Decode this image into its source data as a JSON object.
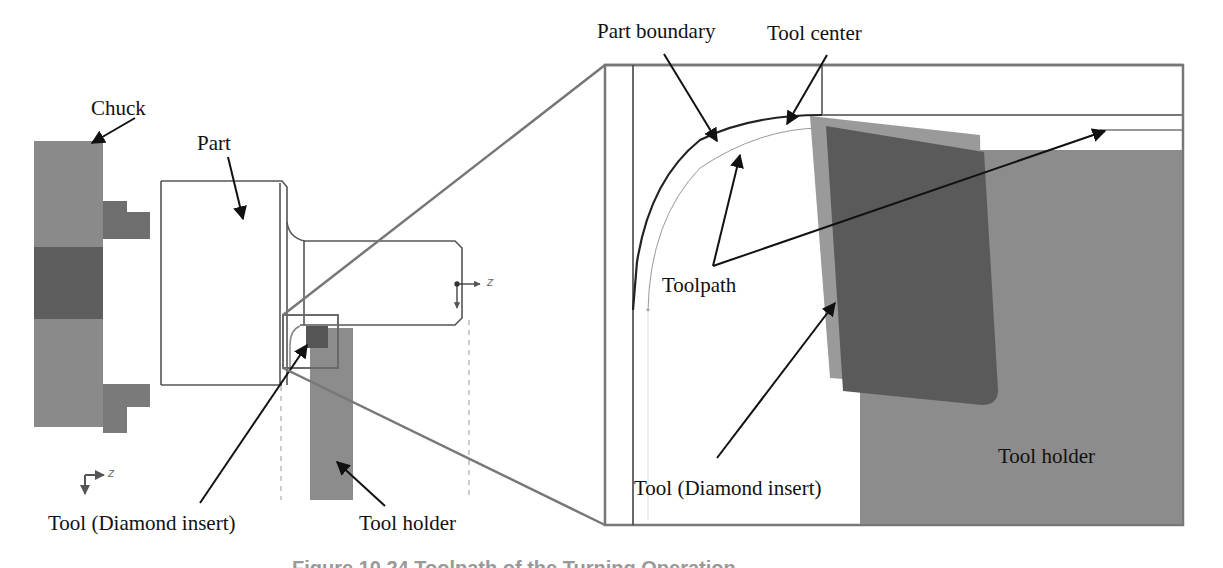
{
  "colors": {
    "chuck": "#8a8a8a",
    "chuck_dark": "#5e5e5e",
    "jaw": "#6e6e6e",
    "part_outline": "#555555",
    "tool_holder": "#8c8c8c",
    "insert": "#5a5a5a",
    "insert_light": "#9a9a9a",
    "leader": "#111111",
    "projection": "#7a7a7a"
  },
  "left_view": {
    "labels": {
      "chuck": "Chuck",
      "part": "Part",
      "tool": "Tool (Diamond insert)",
      "tool_holder": "Tool holder"
    },
    "part_axes": {
      "z": "Z",
      "x": "X"
    },
    "global_axes": {
      "z": "Z",
      "x": "X"
    }
  },
  "detail_view": {
    "labels": {
      "part_boundary": "Part boundary",
      "tool_center": "Tool center",
      "toolpath": "Toolpath",
      "tool": "Tool (Diamond insert)",
      "tool_holder": "Tool holder"
    }
  },
  "caption": "Figure 10.24  Toolpath of the Turning Operation"
}
